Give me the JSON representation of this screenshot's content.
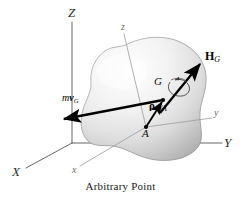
{
  "figure": {
    "caption": "Arbitrary Point",
    "caption_top": 180,
    "background": "#ffffff",
    "body_fill_light": "#fdfdfd",
    "body_fill_mid": "#e2e2e2",
    "body_fill_dark": "#b9b9b9",
    "body_stroke": "#8a8a8a",
    "global_axis_color": "#555555",
    "body_axis_color": "#9a9a9a",
    "vector_color": "#000000"
  },
  "axes": {
    "global": [
      {
        "name": "Z",
        "label": "Z",
        "x": 72,
        "y": 12,
        "tip_x": 72,
        "tip_y": 22
      },
      {
        "name": "X",
        "label": "X",
        "x": 16,
        "y": 172,
        "tip_x": 26,
        "tip_y": 168
      },
      {
        "name": "Y",
        "label": "Y",
        "x": 227,
        "y": 143,
        "tip_x": 222,
        "tip_y": 143
      }
    ],
    "body": [
      {
        "name": "z",
        "label": "z",
        "x": 123,
        "y": 27,
        "tip_x": 124,
        "tip_y": 34
      },
      {
        "name": "x",
        "label": "x",
        "x": 74,
        "y": 170,
        "tip_x": 80,
        "tip_y": 166
      },
      {
        "name": "y",
        "label": "y",
        "x": 216,
        "y": 113,
        "tip_x": 212,
        "tip_y": 118
      }
    ],
    "origin": {
      "x": 72,
      "y": 143
    }
  },
  "points": [
    {
      "name": "G",
      "label": "G",
      "label_x": 155,
      "label_y": 82,
      "dot_x": 163,
      "dot_y": 100,
      "description": "center of mass"
    },
    {
      "name": "A",
      "label": "A",
      "label_x": 143,
      "label_y": 131,
      "dot_x": 146,
      "dot_y": 127,
      "description": "arbitrary point"
    }
  ],
  "vectors": [
    {
      "name": "linear-momentum",
      "symbol_prefix": "m",
      "symbol_bold": "v",
      "symbol_sub": "G",
      "label_x": 65,
      "label_y": 98,
      "from_x": 163,
      "from_y": 100,
      "to_x": 63,
      "to_y": 119,
      "description": "linear momentum vector m v sub G"
    },
    {
      "name": "angular-momentum",
      "symbol_prefix": "",
      "symbol_bold": "H",
      "symbol_sub": "G",
      "label_x": 207,
      "label_y": 57,
      "from_x": 160,
      "from_y": 113,
      "to_x": 201,
      "to_y": 63,
      "description": "angular momentum vector H sub G about G"
    },
    {
      "name": "position-rho",
      "symbol_prefix": "",
      "symbol_bold": "ρ",
      "symbol_sub": "G/A",
      "label_x": 151,
      "label_y": 106,
      "from_x": 146,
      "from_y": 127,
      "to_x": 163,
      "to_y": 101,
      "description": "position vector rho sub G slash A from A to G"
    }
  ],
  "spin": {
    "name": "spin-arc",
    "center_x": 178,
    "center_y": 88,
    "description": "curved double arrow indicating rotation about the angular momentum axis"
  }
}
